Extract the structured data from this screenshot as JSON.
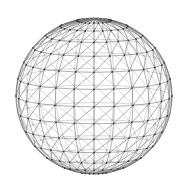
{
  "canvas": {
    "width": 188,
    "height": 192,
    "background_color": "#ffffff"
  },
  "figure": {
    "name": "wireframe-sphere"
  },
  "chart_data": {
    "type": "scatter",
    "subtitle": "",
    "xlabel": "",
    "ylabel": "",
    "grid": false,
    "legend_position": "none",
    "projection": "orthographic",
    "geometry": {
      "shape": "sphere",
      "mesh_type": "uv-sphere-triangulated",
      "center_x": 94,
      "center_y": 96,
      "radius": 78,
      "latitude_bands": 14,
      "longitude_segments": 24,
      "diagonal_split": true,
      "tilt_degrees": 8,
      "vertex_count": 314,
      "edge_count": 936,
      "triangle_count": 624
    },
    "style": {
      "front_edge_color": "#6e6e6e",
      "back_edge_color": "#a8a8a8",
      "front_vertex_color": "#3a3a3a",
      "back_vertex_color": "#b0b0b0",
      "silhouette_color": "#5a5a5a",
      "front_edge_width": 0.55,
      "back_edge_width": 0.45,
      "silhouette_width": 0.7,
      "vertex_radius": 0.85,
      "background_color": "#ffffff"
    },
    "xlim": [
      16,
      172
    ],
    "ylim": [
      18,
      174
    ]
  }
}
